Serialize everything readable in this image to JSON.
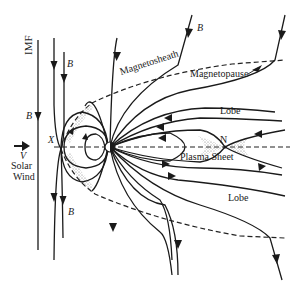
{
  "figure": {
    "labels": {
      "imf": "IMF",
      "b_field": "B",
      "solar_wind_velocity": "V",
      "solar_wind_line1": "Solar",
      "solar_wind_line2": "Wind",
      "magnetosheath": "Magnetosheath",
      "magnetopause": "Magnetopause",
      "lobe_north": "Lobe",
      "lobe_south": "Lobe",
      "dayside_x_line": "X",
      "nightside_neutral_line": "N",
      "plasma_sheet": "Plasma Sheet"
    },
    "colors": {
      "line": "#1a1a1a",
      "background": "#ffffff",
      "stipple": "#888888"
    }
  }
}
